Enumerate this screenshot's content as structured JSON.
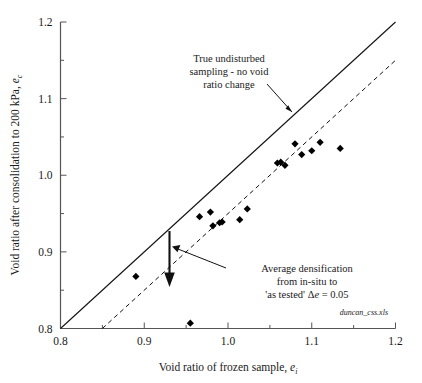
{
  "chart_data": {
    "type": "scatter",
    "title": "",
    "xlabel": "Void ratio of frozen sample, e_i",
    "ylabel": "Void ratio after consolidation to 200 kPa, e_c",
    "xlim": [
      0.8,
      1.2
    ],
    "ylim": [
      0.8,
      1.2
    ],
    "xticks": [
      "0.8",
      "0.9",
      "1.0",
      "1.1",
      "1.2"
    ],
    "xtick_values": [
      0.8,
      0.9,
      1.0,
      1.1,
      1.2
    ],
    "yticks": [
      "0.8",
      "0.9",
      "1.0",
      "1.1",
      "1.2"
    ],
    "ytick_values": [
      0.8,
      0.9,
      1.0,
      1.1,
      1.2
    ],
    "minor_tick_step": 0.05,
    "grid": false,
    "legend": "none",
    "marker": "filled-diamond",
    "marker_color": "#000000",
    "points": [
      {
        "x": 0.89,
        "y": 0.868
      },
      {
        "x": 0.955,
        "y": 0.807
      },
      {
        "x": 0.966,
        "y": 0.946
      },
      {
        "x": 0.979,
        "y": 0.952
      },
      {
        "x": 0.982,
        "y": 0.934
      },
      {
        "x": 0.99,
        "y": 0.938
      },
      {
        "x": 0.993,
        "y": 0.939
      },
      {
        "x": 1.014,
        "y": 0.942
      },
      {
        "x": 1.023,
        "y": 0.956
      },
      {
        "x": 1.059,
        "y": 1.016
      },
      {
        "x": 1.063,
        "y": 1.017
      },
      {
        "x": 1.068,
        "y": 1.013
      },
      {
        "x": 1.08,
        "y": 1.041
      },
      {
        "x": 1.088,
        "y": 1.027
      },
      {
        "x": 1.1,
        "y": 1.032
      },
      {
        "x": 1.11,
        "y": 1.043
      },
      {
        "x": 1.134,
        "y": 1.035
      }
    ],
    "series": [
      {
        "name": "True undisturbed sampling - no void ratio change",
        "type": "line",
        "style": "solid",
        "equation": "y = x",
        "x": [
          0.8,
          1.2
        ],
        "values": [
          0.8,
          1.2
        ]
      },
      {
        "name": "Average densification line",
        "type": "line",
        "style": "dashed",
        "equation": "y = x - 0.05",
        "x": [
          0.85,
          1.2
        ],
        "values": [
          0.8,
          1.15
        ]
      }
    ],
    "annotations": [
      {
        "name": "true-undisturbed-note",
        "lines": [
          "True undisturbed",
          "sampling - no void",
          "ratio change"
        ],
        "points_to": {
          "x": 1.085,
          "y": 1.085
        }
      },
      {
        "name": "average-densification-note",
        "lines": [
          "Average densification",
          "from in-situ to",
          "'as tested' Δe = 0.05"
        ],
        "points_to": {
          "x": 0.935,
          "y": 0.905
        }
      },
      {
        "name": "densification-arrow",
        "from": {
          "x": 0.931,
          "y": 0.931
        },
        "to": {
          "x": 0.931,
          "y": 0.881
        },
        "delta_e": 0.05
      }
    ],
    "file_tag": "duncan_css.xls"
  },
  "axes": {
    "y_title_main": "Void ratio after consolidation to 200 kPa, ",
    "y_title_var": "e",
    "y_title_sub": "c",
    "x_title_main": "Void ratio of frozen sample, ",
    "x_title_var": "e",
    "x_title_sub": "i"
  },
  "annotation_text": {
    "top_line1": "True undisturbed",
    "top_line2": "sampling - no void",
    "top_line3": "ratio change",
    "bottom_line1": "Average densification",
    "bottom_line2": "from in-situ to",
    "bottom_line3_pre": "'as tested' ",
    "bottom_line3_delta": "Δ",
    "bottom_line3_e": "e",
    "bottom_line3_post": " = 0.05"
  },
  "file_tag": "duncan_css.xls",
  "colors": {
    "axis": "#444444",
    "line": "#000000",
    "marker": "#000000",
    "background": "#ffffff"
  }
}
